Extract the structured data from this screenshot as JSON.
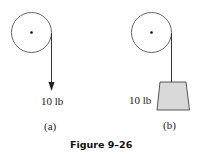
{
  "figure": {
    "caption": "Figure 9–26",
    "panels": [
      {
        "id": "a",
        "label": "(a)",
        "force_label": "10 lb",
        "elements": [
          "pulley",
          "rope",
          "downward-force-arrow"
        ]
      },
      {
        "id": "b",
        "label": "(b)",
        "force_label": "10 lb",
        "elements": [
          "pulley",
          "rope",
          "hanging-block"
        ]
      }
    ]
  },
  "colors": {
    "stroke": "#444444",
    "block_fill": "#d9d9d9",
    "background": "#ffffff"
  }
}
